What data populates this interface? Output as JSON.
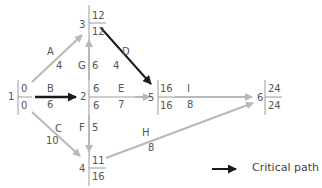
{
  "colors": {
    "normal_arrow": "#b8b8b8",
    "critical_arrow": "#1a1a1a",
    "node_line": "#9a9a9a",
    "text": "#555555"
  },
  "nodes": [
    {
      "id": "1",
      "earliest": "0",
      "latest": "0"
    },
    {
      "id": "2",
      "earliest": "6",
      "latest": "6"
    },
    {
      "id": "3",
      "earliest": "12",
      "latest": "12"
    },
    {
      "id": "4",
      "earliest": "11",
      "latest": "16"
    },
    {
      "id": "5",
      "earliest": "16",
      "latest": "16"
    },
    {
      "id": "6",
      "earliest": "24",
      "latest": "24"
    }
  ],
  "activities": [
    {
      "name": "A",
      "duration": "4",
      "from": "1",
      "to": "3",
      "critical": false
    },
    {
      "name": "B",
      "duration": "6",
      "from": "1",
      "to": "2",
      "critical": true
    },
    {
      "name": "C",
      "duration": "10",
      "from": "1",
      "to": "4",
      "critical": false
    },
    {
      "name": "D",
      "duration": "4",
      "from": "3",
      "to": "5",
      "critical": true
    },
    {
      "name": "E",
      "duration": "7",
      "from": "2",
      "to": "5",
      "critical": false
    },
    {
      "name": "F",
      "duration": "5",
      "from": "2",
      "to": "4",
      "critical": false
    },
    {
      "name": "G",
      "duration": "6",
      "from": "2",
      "to": "3",
      "critical": true
    },
    {
      "name": "H",
      "duration": "8",
      "from": "4",
      "to": "6",
      "critical": false
    },
    {
      "name": "I",
      "duration": "8",
      "from": "5",
      "to": "6",
      "critical": false
    }
  ],
  "legend": {
    "label": "Critical path"
  }
}
